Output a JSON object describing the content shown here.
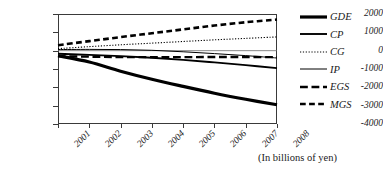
{
  "caption": "(In billions of yen)",
  "chart_data": {
    "type": "line",
    "title": "",
    "xlabel": "",
    "ylabel": "",
    "note": "(In billions of yen)",
    "x": [
      "2001",
      "2002",
      "2003",
      "2004",
      "2005",
      "2006",
      "2007",
      "2008"
    ],
    "xlim": [
      "2001",
      "2008"
    ],
    "ylim": [
      -4000,
      2000
    ],
    "yticks": [
      2000,
      1000,
      0,
      -1000,
      -2000,
      -3000,
      -4000
    ],
    "ytick_labels": [
      "2000",
      "1000",
      "0",
      "-1000",
      "-2000",
      "-3000",
      "-4000"
    ],
    "grid": false,
    "legend_position": "right",
    "series": [
      {
        "name": "GDE",
        "style": "solid",
        "width": 3.2,
        "color": "#000000",
        "values": [
          -280,
          -620,
          -1120,
          -1560,
          -1950,
          -2320,
          -2650,
          -2950
        ]
      },
      {
        "name": "CP",
        "style": "solid",
        "width": 1.9,
        "color": "#000000",
        "values": [
          -170,
          -230,
          -300,
          -390,
          -500,
          -640,
          -790,
          -950
        ]
      },
      {
        "name": "CG",
        "style": "dotted",
        "width": 1.1,
        "color": "#000000",
        "values": [
          110,
          220,
          320,
          410,
          500,
          590,
          670,
          750
        ]
      },
      {
        "name": "IP",
        "style": "solid",
        "width": 1.0,
        "color": "#000000",
        "values": [
          60,
          70,
          60,
          20,
          -60,
          -160,
          -270,
          -400
        ]
      },
      {
        "name": "EGS",
        "style": "long-dash",
        "width": 2.3,
        "color": "#000000",
        "values": [
          -300,
          -330,
          -350,
          -355,
          -350,
          -345,
          -345,
          -350
        ]
      },
      {
        "name": "MGS",
        "style": "dash",
        "width": 2.6,
        "color": "#000000",
        "values": [
          300,
          520,
          740,
          950,
          1160,
          1370,
          1550,
          1700
        ]
      }
    ]
  }
}
